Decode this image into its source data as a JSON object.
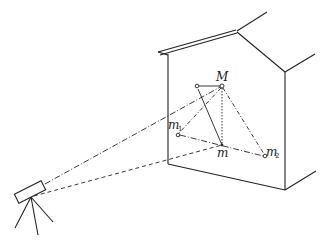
{
  "diagram": {
    "type": "surveying-scene",
    "labels": {
      "M": "M",
      "m": "m",
      "m1_base": "m",
      "m1_sub": "1",
      "m2_base": "m",
      "m2_sub": "2"
    },
    "points": [
      {
        "id": "M",
        "x": 222,
        "y": 86
      },
      {
        "id": "aux",
        "x": 197,
        "y": 86
      },
      {
        "id": "m1",
        "x": 178,
        "y": 135
      },
      {
        "id": "m",
        "x": 222,
        "y": 145
      },
      {
        "id": "m2",
        "x": 265,
        "y": 156
      }
    ],
    "colors": {
      "stroke": "#222222",
      "background": "#ffffff"
    }
  }
}
